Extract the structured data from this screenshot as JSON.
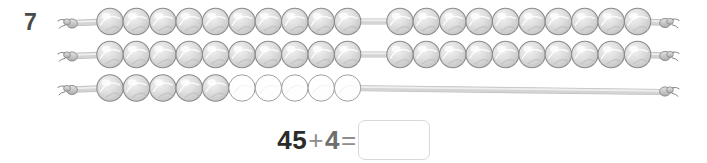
{
  "question": {
    "number": "7",
    "type": "rekenrek-bead-string"
  },
  "colors": {
    "bead_filled_fill": "#d9d9d9",
    "bead_filled_stroke": "#8a8a8a",
    "bead_empty_fill": "#ffffff",
    "bead_empty_stroke": "#9a9a9a",
    "string_color": "#b8b8b8",
    "string_stroke": "#8a8a8a",
    "number_color": "#4a4a4a",
    "answer_box_border": "#d8d8d8"
  },
  "rekenrek": {
    "rows": [
      {
        "name": "row-1",
        "left_group_filled": 10,
        "left_group_empty": 0,
        "right_group_filled": 10,
        "right_group_empty": 0,
        "total_filled": 20
      },
      {
        "name": "row-2",
        "left_group_filled": 10,
        "left_group_empty": 0,
        "right_group_filled": 10,
        "right_group_empty": 0,
        "total_filled": 20
      },
      {
        "name": "row-3",
        "left_group_filled": 5,
        "left_group_empty": 5,
        "right_group_filled": 0,
        "right_group_empty": 0,
        "total_filled": 5
      }
    ],
    "total_beads_shown": 45
  },
  "equation": {
    "first_number": "45",
    "plus_sign": "+",
    "second_number": "4",
    "equals_sign": "=",
    "answer_value": "",
    "answer_placeholder": ""
  },
  "icons": {
    "knot_left": "string-knot-left-icon",
    "knot_right": "string-knot-right-icon"
  }
}
